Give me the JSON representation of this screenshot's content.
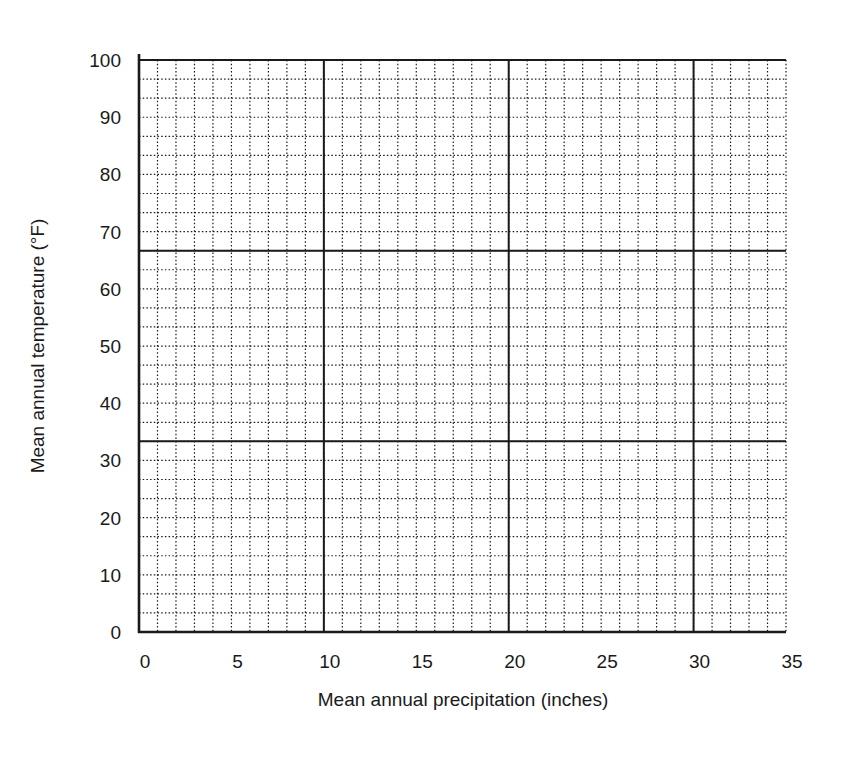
{
  "chart_data": {
    "type": "scatter",
    "title": "",
    "xlabel": "Mean annual precipitation (inches)",
    "ylabel": "Mean annual temperature (°F)",
    "xlim": [
      0,
      35
    ],
    "ylim": [
      0,
      100
    ],
    "x_ticks": [
      0,
      5,
      10,
      15,
      20,
      25,
      30,
      35
    ],
    "y_ticks": [
      0,
      10,
      20,
      30,
      40,
      50,
      60,
      70,
      80,
      90,
      100
    ],
    "x_tick_labels": [
      "0",
      "5",
      "10",
      "15",
      "20",
      "25",
      "30",
      "35"
    ],
    "y_tick_labels": [
      "0",
      "10",
      "20",
      "30",
      "40",
      "50",
      "60",
      "70",
      "80",
      "90",
      "100"
    ],
    "grid": true,
    "minor_grid": {
      "x_step": 1,
      "y_step": 3.333,
      "style": "dotted"
    },
    "major_grid": {
      "x_lines": [
        10,
        20,
        30
      ],
      "y_lines": [
        33.33,
        66.67
      ],
      "style": "solid"
    },
    "series": [],
    "note": "Blank graph paper; no data points plotted"
  },
  "colors": {
    "line": "#1a1a1a",
    "background": "#ffffff"
  }
}
